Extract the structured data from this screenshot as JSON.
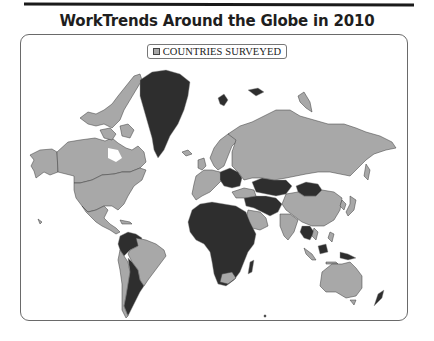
{
  "title": "WorkTrends Around the Globe in 2010",
  "legend": {
    "items": [
      {
        "label": "COUNTRIES SURVEYED",
        "swatch_color": "#a8a8a8"
      }
    ]
  },
  "map": {
    "projection": "world (Miller-like)",
    "surveyed_color": "#a8a8a8",
    "not_surveyed_color": "#2e2e2e",
    "surveyed_regions": [
      "Canada",
      "United States",
      "Mexico",
      "Brazil",
      "Chile",
      "Western Europe",
      "Scandinavia",
      "Russia",
      "China",
      "India",
      "Japan",
      "Saudi Arabia",
      "UAE",
      "Turkey",
      "Australia",
      "New Zealand",
      "South Korea",
      "Colombia",
      "Peru"
    ],
    "not_surveyed_regions": [
      "Greenland",
      "Africa",
      "Central Asia",
      "Mongolia",
      "Middle East (part)",
      "Southeast Asia (part)",
      "Argentina",
      "Eastern Europe (part)"
    ]
  }
}
